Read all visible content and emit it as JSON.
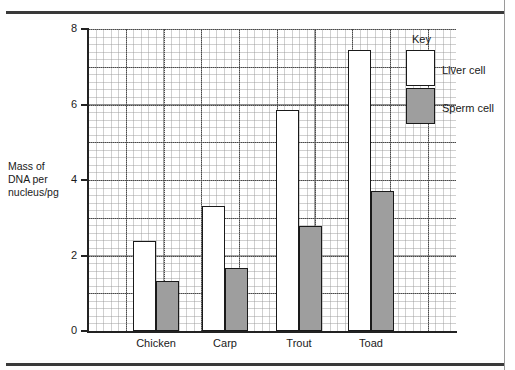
{
  "chart_data": {
    "type": "bar",
    "title": "",
    "xlabel": "",
    "ylabel": "Mass of DNA per nucleus/pg",
    "ylabel_lines": [
      "Mass of",
      "DNA per",
      "nucleus/pg"
    ],
    "ylim": [
      0,
      8
    ],
    "ytick_labels": [
      "0",
      "2",
      "4",
      "6",
      "8"
    ],
    "ytick_values": [
      0,
      2,
      4,
      6,
      8
    ],
    "minor_gridline_step": 0.2,
    "major_gridline_step": 1.0,
    "grid": true,
    "legend_position": "top-right",
    "categories": [
      "Chicken",
      "Carp",
      "Trout",
      "Toad"
    ],
    "series": [
      {
        "name": "Liver cell",
        "fill": "#ffffff",
        "values": [
          2.38,
          3.3,
          5.85,
          7.45
        ]
      },
      {
        "name": "Sperm cell",
        "fill": "#9e9e9e",
        "values": [
          1.32,
          1.67,
          2.78,
          3.7
        ]
      }
    ]
  },
  "legend": {
    "title": "Key",
    "entries": [
      {
        "label": "Liver cell"
      },
      {
        "label": "Sperm cell"
      }
    ]
  },
  "colors": {
    "liver_cell": "#ffffff",
    "sperm_cell": "#9e9e9e",
    "axis": "#222222",
    "grid_major": "#5a5a5a",
    "grid_minor": "#969696",
    "rule": "#3a3a3a"
  }
}
